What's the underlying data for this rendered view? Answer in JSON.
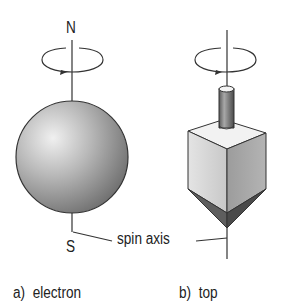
{
  "diagram": {
    "electron": {
      "north_label": "N",
      "south_label": "S",
      "caption": "a)  electron"
    },
    "top": {
      "caption": "b)  top"
    },
    "shared_label": "spin axis",
    "colors": {
      "line": "#333333",
      "sphere_light": "#e6e6e6",
      "sphere_dark": "#7a7a7a",
      "cube_left": "#d6d6d6",
      "cube_right": "#9a9a9a",
      "cube_top": "#f2f2f2",
      "pyramid_dark": "#555555"
    }
  }
}
